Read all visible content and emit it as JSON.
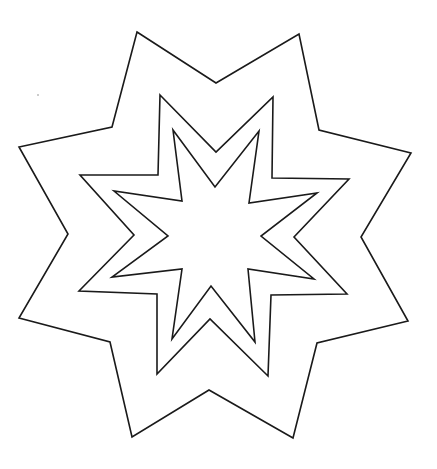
{
  "image": {
    "width": 437,
    "height": 469,
    "background": "#ffffff",
    "description": "Line drawing of three nested eight-pointed star outlines"
  },
  "drawing": {
    "stroke_color": "#1a1a1a",
    "stars": [
      {
        "name": "outer-star",
        "points": "137,32 216,83 299,34 319,130 411,153 361,237 408,321 317,343 293,438 209,390 132,437 110,342 19,318 68,234 19,147 112,127"
      },
      {
        "name": "middle-star",
        "points": "160,95 216,152 273,97 272,178 349,179 294,237 347,294 271,295 268,376 210,319 157,374 157,294 79,291 134,235 80,175 158,175"
      },
      {
        "name": "inner-star",
        "points": "173,130 215,187 259,131 249,203 317,193 261,236 314,279 248,269 255,342 211,286 172,339 182,269 112,277 168,236 114,191 182,201"
      }
    ],
    "speck": {
      "x": 37,
      "y": 94,
      "color": "#bbbbbb"
    }
  }
}
